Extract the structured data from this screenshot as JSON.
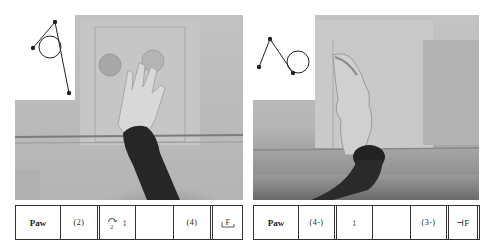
{
  "figures": [
    {
      "id": "left",
      "photo_description": "Hand/paw raised upward against a gridded background board, dark sleeve at bottom",
      "diagram_icon": "stick-figure-limb-with-circle-joint",
      "notation_row": [
        {
          "text": "Paw",
          "kind": "label"
        },
        {
          "text": "(2)",
          "kind": "value"
        },
        {
          "text": "↕",
          "kind": "symbol",
          "prefix_glyph": "ⓢ",
          "prefix_sub": "2",
          "icon": "turn-and-vertical-arrow-icon"
        },
        {
          "text": "",
          "kind": "blank"
        },
        {
          "text": "(4)",
          "kind": "value"
        },
        {
          "text": "F",
          "kind": "symbol",
          "icon": "floor-bracket-F-icon"
        }
      ]
    },
    {
      "id": "right",
      "photo_description": "Foot/paw lifted vertically with leg extended, dark limb at bottom against gridded board",
      "diagram_icon": "stick-figure-zigzag-with-circle",
      "notation_row": [
        {
          "text": "Paw",
          "kind": "label"
        },
        {
          "text": "(4-)",
          "kind": "value"
        },
        {
          "text": "↕",
          "kind": "symbol",
          "icon": "vertical-arrow-icon"
        },
        {
          "text": "",
          "kind": "blank"
        },
        {
          "text": "(3-)",
          "kind": "value"
        },
        {
          "text": "⊣F",
          "kind": "symbol",
          "icon": "tack-F-icon"
        }
      ]
    }
  ],
  "colors": {
    "photo_light": "#cfcfcf",
    "photo_mid": "#a9a9a9",
    "photo_dark": "#2b2b2b",
    "line": "#333333"
  }
}
